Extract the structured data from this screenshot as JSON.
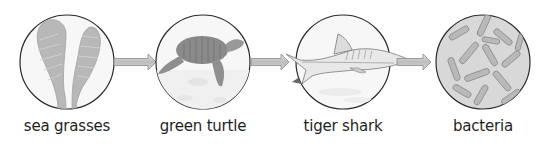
{
  "diagram": {
    "type": "food-chain",
    "nodes": [
      {
        "id": "sea-grasses",
        "label": "sea grasses",
        "illustration": "seagrass-icon"
      },
      {
        "id": "green-turtle",
        "label": "green turtle",
        "illustration": "turtle-icon"
      },
      {
        "id": "tiger-shark",
        "label": "tiger shark",
        "illustration": "shark-icon"
      },
      {
        "id": "bacteria",
        "label": "bacteria",
        "illustration": "bacteria-icon"
      }
    ],
    "edges": [
      {
        "from": "sea-grasses",
        "to": "green-turtle"
      },
      {
        "from": "green-turtle",
        "to": "tiger-shark"
      },
      {
        "from": "tiger-shark",
        "to": "bacteria"
      }
    ],
    "colors": {
      "circle_stroke": "#2a2a2a",
      "arrow_fill": "#c8c8c8",
      "arrow_stroke": "#8a8a8a",
      "illustration_gray": "#b0b0b0"
    }
  }
}
